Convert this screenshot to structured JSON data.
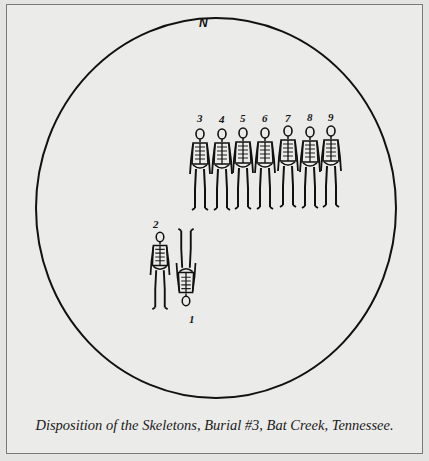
{
  "figure": {
    "caption": "Disposition of the Skeletons, Burial #3, Bat Creek, Tennessee.",
    "compass_label": "N",
    "boundary_shape": "circle",
    "skeletons_row": {
      "orientation": "standing row, heads north",
      "labels": [
        "3",
        "4",
        "5",
        "6",
        "7",
        "8",
        "9"
      ]
    },
    "skeletons_pair": {
      "labels": [
        "2",
        "1"
      ],
      "notes": "2 upright, 1 inverted (head to south) lying beside 2"
    },
    "colors": {
      "paper": "#ebebe9",
      "ink": "#111111",
      "frame": "#7a7a78"
    }
  }
}
